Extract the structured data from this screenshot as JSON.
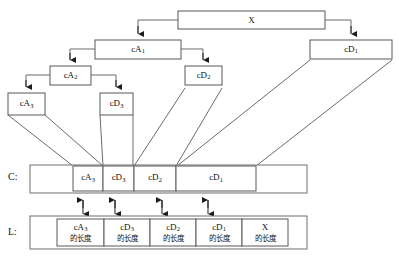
{
  "figure": {
    "background_color": "#ffffff",
    "line_color": "#6b6b6b",
    "text_color": "#111111"
  },
  "tree": {
    "root": {
      "base": "X",
      "sub": ""
    },
    "nodes": [
      {
        "id": "cA1",
        "base": "cA",
        "sub": "1"
      },
      {
        "id": "cD1",
        "base": "cD",
        "sub": "1"
      },
      {
        "id": "cA2",
        "base": "cA",
        "sub": "2"
      },
      {
        "id": "cD2",
        "base": "cD",
        "sub": "2"
      },
      {
        "id": "cA3",
        "base": "cA",
        "sub": "3"
      },
      {
        "id": "cD3",
        "base": "cD",
        "sub": "3"
      }
    ]
  },
  "rows": {
    "c_row": {
      "label": "C:",
      "cells": [
        {
          "base": "cA",
          "sub": "3"
        },
        {
          "base": "cD",
          "sub": "3"
        },
        {
          "base": "cD",
          "sub": "2"
        },
        {
          "base": "cD",
          "sub": "1"
        }
      ]
    },
    "l_row": {
      "label": "L:",
      "suffix": "的长度",
      "cells": [
        {
          "base": "cA",
          "sub": "3",
          "suffix": "的长度"
        },
        {
          "base": "cD",
          "sub": "3",
          "suffix": "的长度"
        },
        {
          "base": "cD",
          "sub": "2",
          "suffix": "的长度"
        },
        {
          "base": "cD",
          "sub": "1",
          "suffix": "的长度"
        },
        {
          "base": "X",
          "sub": "",
          "suffix": "的长度"
        }
      ]
    }
  }
}
